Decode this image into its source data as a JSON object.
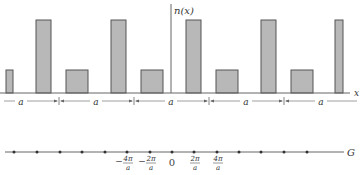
{
  "diagram": {
    "top_panel": {
      "y_axis_label": "n(x)",
      "x_axis_label": "x",
      "period_label": "a",
      "description": "Periodic density n(x) with period a: alternating tall and short rectangular bars",
      "bar_fill": "#b8b8b8",
      "bar_stroke": "#555555",
      "bars": [
        {
          "type": "short",
          "x": 6,
          "w": 7
        },
        {
          "type": "tall",
          "x": 36,
          "w": 15
        },
        {
          "type": "short",
          "x": 66,
          "w": 22
        },
        {
          "type": "tall",
          "x": 111,
          "w": 15
        },
        {
          "type": "short",
          "x": 141,
          "w": 22
        },
        {
          "type": "tall",
          "x": 186,
          "w": 15
        },
        {
          "type": "short",
          "x": 216,
          "w": 22
        },
        {
          "type": "tall",
          "x": 261,
          "w": 15
        },
        {
          "type": "short",
          "x": 291,
          "w": 22
        },
        {
          "type": "tall",
          "x": 335,
          "w": 8
        }
      ],
      "period_markers": [
        59,
        134,
        209,
        284
      ],
      "period_segments": [
        {
          "label": "a",
          "x_center": 21
        },
        {
          "label": "a",
          "x_center": 96
        },
        {
          "label": "a",
          "x_center": 171
        },
        {
          "label": "a",
          "x_center": 246
        },
        {
          "label": "a",
          "x_center": 321
        }
      ]
    },
    "bottom_panel": {
      "axis_label": "G",
      "description": "Reciprocal lattice points spaced 2π/a",
      "points_x": [
        14,
        37,
        60,
        82,
        105,
        127,
        150,
        172,
        194,
        217,
        239,
        261,
        284,
        307
      ],
      "tick_labels": [
        {
          "text_num": "4π",
          "text_den": "a",
          "sign": "−",
          "x": 127
        },
        {
          "text_num": "2π",
          "text_den": "a",
          "sign": "−",
          "x": 150
        },
        {
          "text": "0",
          "x": 172
        },
        {
          "text_num": "2π",
          "text_den": "a",
          "sign": "",
          "x": 194
        },
        {
          "text_num": "4π",
          "text_den": "a",
          "sign": "",
          "x": 217
        }
      ]
    }
  }
}
